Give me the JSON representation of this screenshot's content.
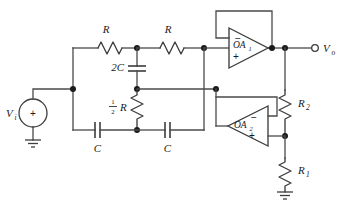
{
  "diagram": {
    "type": "electronic-circuit-schematic",
    "ink_color": "#3d3d3d",
    "background_color": "#ffffff"
  },
  "source": {
    "label": "V",
    "sublabel": "i",
    "polarity": "+",
    "name": "input-voltage-source"
  },
  "output": {
    "label": "V",
    "sublabel": "o",
    "terminal": "open-circle",
    "name": "output-terminal"
  },
  "resistors": [
    {
      "id": "R-top-left",
      "label": "R",
      "sublabel": "",
      "orientation": "horizontal"
    },
    {
      "id": "R-top-right",
      "label": "R",
      "sublabel": "",
      "orientation": "horizontal"
    },
    {
      "id": "R-half",
      "label": "R",
      "sublabel": "",
      "prefix_num": "1",
      "prefix_den": "2",
      "orientation": "vertical"
    },
    {
      "id": "R2",
      "label": "R",
      "sublabel": "2",
      "orientation": "vertical"
    },
    {
      "id": "R1",
      "label": "R",
      "sublabel": "1",
      "orientation": "vertical"
    }
  ],
  "capacitors": [
    {
      "id": "C-2C",
      "label": "2C",
      "orientation": "vertical"
    },
    {
      "id": "C-bottom-left",
      "label": "C",
      "orientation": "horizontal"
    },
    {
      "id": "C-bottom-right",
      "label": "C",
      "orientation": "horizontal"
    }
  ],
  "opamps": [
    {
      "id": "OA1",
      "label": "OA",
      "sublabel": "1",
      "minus": "−",
      "plus": "+",
      "orientation": "points-right"
    },
    {
      "id": "OA2",
      "label": "OA",
      "sublabel": "2",
      "minus": "−",
      "plus": "+",
      "orientation": "points-left"
    }
  ],
  "grounds": [
    {
      "id": "gnd-source",
      "name": "ground-source"
    },
    {
      "id": "gnd-r1",
      "name": "ground-r1"
    }
  ]
}
